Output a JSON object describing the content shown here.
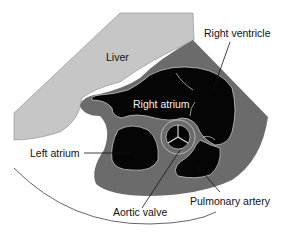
{
  "diagram": {
    "type": "anatomical ultrasound schematic (subcostal view of the heart)",
    "colors": {
      "background": "#ffffff",
      "liver": "#c6c6c6",
      "myocardium": "#6b6b6b",
      "chamber": "#050505",
      "outline": "#d8d8d8",
      "leader_line": "#111111"
    },
    "labels": {
      "liver": "Liver",
      "right_ventricle": "Right ventricle",
      "right_atrium": "Right atrium",
      "left_atrium": "Left atrium",
      "aortic_valve": "Aortic valve",
      "pulmonary_artery": "Pulmonary artery"
    }
  }
}
